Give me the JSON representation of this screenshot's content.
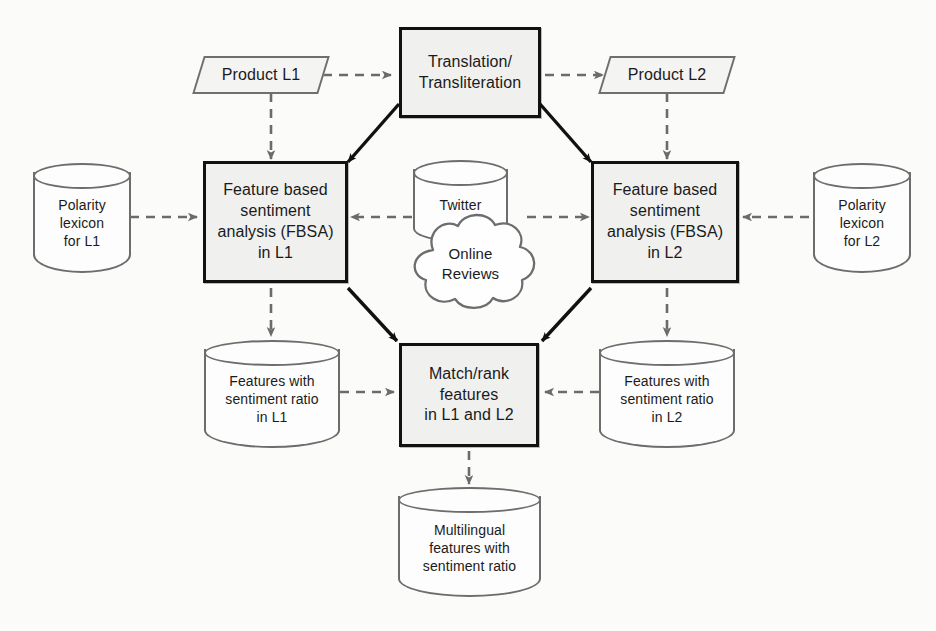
{
  "diagram": {
    "colors": {
      "page_background": "#fbfbfa",
      "process_fill": "#f0f0ef",
      "process_stroke": "#111111",
      "data_stroke": "#6d6d6d",
      "data_fill": "#fdfdfd",
      "solid_arrow": "#111111",
      "dashed_arrow": "#6b6b6b"
    },
    "nodes": [
      {
        "id": "product_l1",
        "shape": "parallelogram",
        "label": "Product L1"
      },
      {
        "id": "translation",
        "shape": "process",
        "label": "Translation/\nTransliteration"
      },
      {
        "id": "product_l2",
        "shape": "parallelogram",
        "label": "Product L2"
      },
      {
        "id": "lexicon_l1",
        "shape": "cylinder",
        "label": "Polarity\nlexicon\nfor L1"
      },
      {
        "id": "fbsa_l1",
        "shape": "process",
        "label": "Feature based\nsentiment\nanalysis (FBSA)\nin L1"
      },
      {
        "id": "twitter",
        "shape": "cylinder",
        "label": "Twitter"
      },
      {
        "id": "online_reviews",
        "shape": "cloud",
        "label": "Online\nReviews"
      },
      {
        "id": "fbsa_l2",
        "shape": "process",
        "label": "Feature based\nsentiment\nanalysis (FBSA)\nin L2"
      },
      {
        "id": "lexicon_l2",
        "shape": "cylinder",
        "label": "Polarity\nlexicon\nfor L2"
      },
      {
        "id": "features_l1",
        "shape": "cylinder",
        "label": "Features with\nsentiment ratio\nin L1"
      },
      {
        "id": "match_rank",
        "shape": "process",
        "label": "Match/rank\nfeatures\nin L1 and L2"
      },
      {
        "id": "features_l2",
        "shape": "cylinder",
        "label": "Features with\nsentiment ratio\nin L2"
      },
      {
        "id": "multilingual",
        "shape": "cylinder",
        "label": "Multilingual\nfeatures with\nsentiment ratio"
      }
    ],
    "edges": [
      {
        "from": "product_l1",
        "to": "translation",
        "style": "dashed"
      },
      {
        "from": "translation",
        "to": "product_l2",
        "style": "dashed"
      },
      {
        "from": "product_l1",
        "to": "fbsa_l1",
        "style": "dashed"
      },
      {
        "from": "product_l2",
        "to": "fbsa_l2",
        "style": "dashed"
      },
      {
        "from": "translation",
        "to": "fbsa_l1",
        "style": "solid"
      },
      {
        "from": "translation",
        "to": "fbsa_l2",
        "style": "solid"
      },
      {
        "from": "lexicon_l1",
        "to": "fbsa_l1",
        "style": "dashed"
      },
      {
        "from": "lexicon_l2",
        "to": "fbsa_l2",
        "style": "dashed"
      },
      {
        "from": "online_reviews",
        "to": "fbsa_l1",
        "style": "dashed"
      },
      {
        "from": "online_reviews",
        "to": "fbsa_l2",
        "style": "dashed"
      },
      {
        "from": "fbsa_l1",
        "to": "features_l1",
        "style": "dashed"
      },
      {
        "from": "fbsa_l2",
        "to": "features_l2",
        "style": "dashed"
      },
      {
        "from": "fbsa_l1",
        "to": "match_rank",
        "style": "solid"
      },
      {
        "from": "fbsa_l2",
        "to": "match_rank",
        "style": "solid"
      },
      {
        "from": "features_l1",
        "to": "match_rank",
        "style": "dashed"
      },
      {
        "from": "features_l2",
        "to": "match_rank",
        "style": "dashed"
      },
      {
        "from": "match_rank",
        "to": "multilingual",
        "style": "dashed"
      }
    ]
  }
}
